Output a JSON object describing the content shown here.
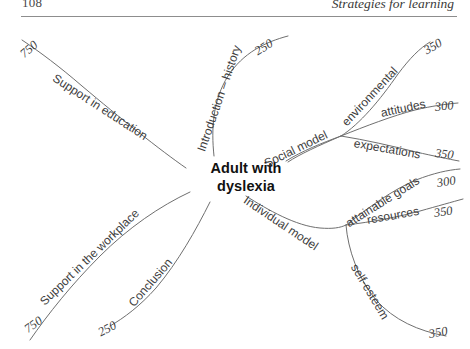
{
  "page": {
    "folio": "108",
    "running_head": "Strategies for learning",
    "background_color": "#ffffff",
    "line_color": "#6f6f6f",
    "text_color": "#3d3d3d"
  },
  "diagram": {
    "type": "mind-map",
    "center": "Adult with dyslexia",
    "center_line1": "Adult with",
    "center_line2": "dyslexia",
    "branches": [
      {
        "id": "support-in-education",
        "label": "Support in education",
        "value": "750",
        "position": "top-left"
      },
      {
        "id": "introduction-history",
        "label": "Introduction – history",
        "value": "250",
        "position": "top-center"
      },
      {
        "id": "social-model",
        "label": "Social model",
        "value": "",
        "position": "top-right",
        "children": [
          {
            "id": "environmental",
            "label": "environmental",
            "value": "350"
          },
          {
            "id": "attitudes",
            "label": "attitudes",
            "value": "300"
          },
          {
            "id": "expectations",
            "label": "expectations",
            "value": "350"
          }
        ]
      },
      {
        "id": "individual-model",
        "label": "Individual model",
        "value": "",
        "position": "bottom-right",
        "children": [
          {
            "id": "attainable-goals",
            "label": "attainable goals",
            "value": "300"
          },
          {
            "id": "resources",
            "label": "resources",
            "value": "350"
          },
          {
            "id": "self-esteem",
            "label": "self-esteem",
            "value": "350"
          }
        ]
      },
      {
        "id": "conclusion",
        "label": "Conclusion",
        "value": "250",
        "position": "bottom-center"
      },
      {
        "id": "support-in-the-workplace",
        "label": "Support in the workplace",
        "value": "750",
        "position": "bottom-left"
      }
    ]
  }
}
